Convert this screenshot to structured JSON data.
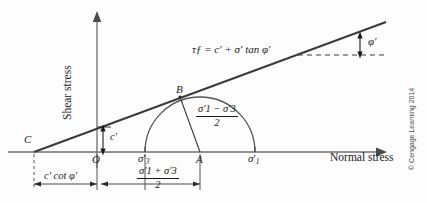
{
  "figure": {
    "domain": "diagram",
    "title_axes": {
      "y_axis_label": "Shear stress",
      "x_axis_label": "Normal stress"
    },
    "credit": "© Cengage Learning 2014",
    "colors": {
      "background": "#fdfdfd",
      "ink": "#1a1a1a",
      "axis": "#6e6e6e",
      "circle": "#555555",
      "dashed": "#444444"
    },
    "points": {
      "C": "C",
      "O": "O",
      "A": "A",
      "B": "B"
    },
    "axis_ticks": {
      "sigma3": "σ",
      "sigma3_sub": "3",
      "sigma1": "σ",
      "sigma1_sub": "1",
      "prime": "′"
    },
    "annotations": {
      "envelope_equation": "τƒ = c′ + σ′ tan φ′",
      "friction_angle": "φ′",
      "cohesion": "c′",
      "radius_numerator": "σ′1 − σ′3",
      "radius_denominator": "2",
      "ccot_dimension": "c′ cot φ′",
      "center_numerator": "σ′1 + σ′3",
      "center_denominator": "2"
    },
    "geometry": {
      "x_axis_y": 152,
      "y_axis_x": 97,
      "point_C_x": 34,
      "point_O_x": 97,
      "sigma3_x": 145,
      "point_A_x": 200,
      "sigma1_x": 255,
      "circle_radius": 55,
      "point_B_x": 180,
      "point_B_y": 97,
      "envelope_start_x": 34,
      "envelope_end_x": 386,
      "envelope_end_y": 22,
      "dashed_line_y": 55,
      "dashed_start_x": 298,
      "dashed_end_x": 387,
      "cohesion_intercept_y": 128
    }
  }
}
